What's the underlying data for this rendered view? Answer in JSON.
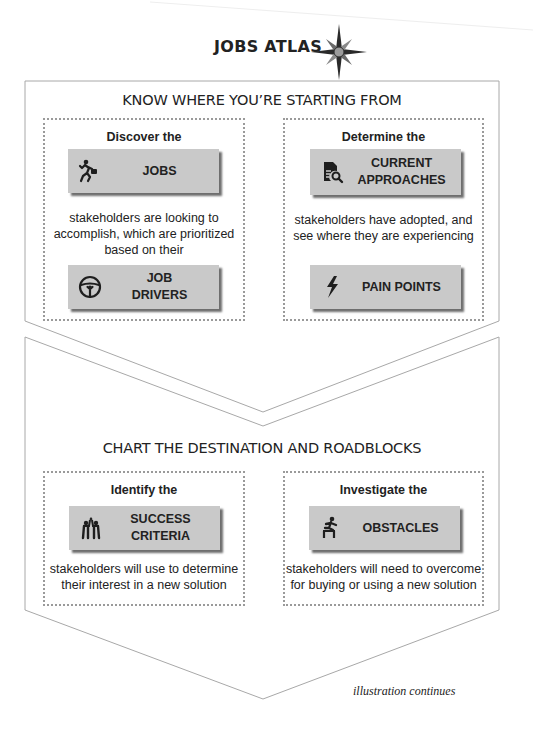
{
  "header": {
    "title": "JOBS ATLAS",
    "icon": "compass-rose-icon"
  },
  "sections": [
    {
      "title": "KNOW WHERE YOU’RE STARTING FROM",
      "panels": [
        {
          "lead": "Discover the",
          "cards": [
            {
              "label": "JOBS",
              "icon": "running-businessman-icon"
            },
            {
              "label": "JOB\nDRIVERS",
              "icon": "steering-wheel-icon"
            }
          ],
          "description": "stakeholders are looking to accomplish, which are prioritized based on their"
        },
        {
          "lead": "Determine the",
          "cards": [
            {
              "label": "CURRENT\nAPPROACHES",
              "icon": "document-search-icon"
            },
            {
              "label": "PAIN POINTS",
              "icon": "lightning-bolt-icon"
            }
          ],
          "description": "stakeholders have adopted, and see where they are experiencing"
        }
      ]
    },
    {
      "title": "CHART THE DESTINATION AND ROADBLOCKS",
      "panels": [
        {
          "lead": "Identify the",
          "cards": [
            {
              "label": "SUCCESS\nCRITERIA",
              "icon": "team-celebration-icon"
            }
          ],
          "description": "stakeholders will use to determine their interest in a new solution"
        },
        {
          "lead": "Investigate the",
          "cards": [
            {
              "label": "OBSTACLES",
              "icon": "hurdle-jumper-icon"
            }
          ],
          "description": "stakeholders will need to overcome for buying or using a new solution"
        }
      ]
    }
  ],
  "footer": {
    "note": "illustration continues"
  },
  "colors": {
    "card_fill": "#c9c9c9",
    "card_shadow": "#6e6e6e",
    "outline": "#a8a8a8",
    "text": "#222222"
  }
}
